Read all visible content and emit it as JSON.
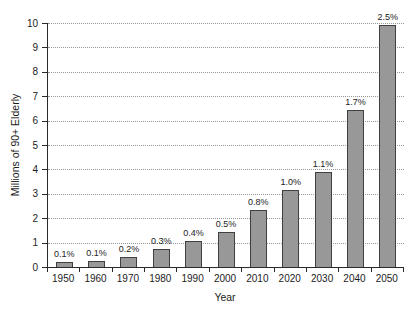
{
  "chart_data": {
    "type": "bar",
    "title": "",
    "xlabel": "Year",
    "ylabel": "Millions of 90+ Elderly",
    "categories": [
      "1950",
      "1960",
      "1970",
      "1980",
      "1990",
      "2000",
      "2010",
      "2020",
      "2030",
      "2040",
      "2050"
    ],
    "values": [
      0.22,
      0.26,
      0.4,
      0.72,
      1.05,
      1.45,
      2.35,
      3.15,
      3.9,
      6.45,
      9.9
    ],
    "bar_labels": [
      "0.1%",
      "0.1%",
      "0.2%",
      "0.3%",
      "0.4%",
      "0.5%",
      "0.8%",
      "1.0%",
      "1.1%",
      "1.7%",
      "2.5%"
    ],
    "ylim": [
      0,
      10
    ],
    "yticks": [
      0,
      1,
      2,
      3,
      4,
      5,
      6,
      7,
      8,
      9,
      10
    ],
    "grid": "dotted horizontal gridlines at each integer",
    "legend": "none",
    "bar_color": "#989898",
    "bar_border_color": "#404040",
    "gridline_color": "#979797",
    "axis_color": "#2a2a2a",
    "text_color": "#1c1c1c",
    "background_color": "#ffffff"
  }
}
